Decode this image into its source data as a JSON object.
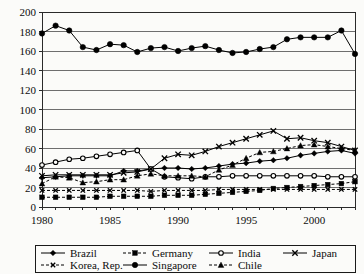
{
  "chart_data": {
    "type": "line",
    "title": "",
    "xlabel": "",
    "ylabel": "",
    "ylim": [
      0,
      200
    ],
    "ytick_step": 20,
    "yticks": [
      0,
      20,
      40,
      60,
      80,
      100,
      120,
      140,
      160,
      180,
      200
    ],
    "xlim": [
      1980,
      2003
    ],
    "xticks": [
      1980,
      1985,
      1990,
      1995,
      2000
    ],
    "x": [
      1980,
      1981,
      1982,
      1983,
      1984,
      1985,
      1986,
      1987,
      1988,
      1989,
      1990,
      1991,
      1992,
      1993,
      1994,
      1995,
      1996,
      1997,
      1998,
      1999,
      2000,
      2001,
      2002,
      2003
    ],
    "grid": "horizontal",
    "legend_position": "bottom",
    "series": [
      {
        "name": "Brazil",
        "marker": "filled-diamond",
        "dash": "solid",
        "values": [
          30,
          31,
          32,
          32,
          32,
          32,
          37,
          37,
          39,
          40,
          40,
          39,
          40,
          42,
          44,
          45,
          47,
          48,
          50,
          53,
          55,
          57,
          58,
          55
        ]
      },
      {
        "name": "Germany",
        "marker": "filled-square",
        "dash": "dashed",
        "values": [
          10,
          10,
          10,
          10,
          10,
          11,
          11,
          11,
          11,
          12,
          12,
          12,
          13,
          14,
          15,
          16,
          17,
          19,
          20,
          21,
          22,
          23,
          24,
          26
        ]
      },
      {
        "name": "India",
        "marker": "open-circle",
        "dash": "solid",
        "values": [
          43,
          46,
          49,
          50,
          52,
          54,
          56,
          58,
          39,
          31,
          30,
          29,
          31,
          31,
          32,
          32,
          32,
          32,
          32,
          32,
          32,
          31,
          31,
          31
        ]
      },
      {
        "name": "Japan",
        "marker": "x-cross",
        "dash": "solid",
        "values": [
          32,
          33,
          33,
          33,
          33,
          33,
          35,
          36,
          39,
          50,
          54,
          53,
          57,
          62,
          66,
          70,
          74,
          78,
          70,
          71,
          68,
          66,
          62,
          58
        ]
      },
      {
        "name": "Korea, Rep.",
        "marker": "x-small",
        "dash": "dashed",
        "values": [
          17,
          17,
          17,
          17,
          17,
          17,
          17,
          17,
          16,
          17,
          17,
          17,
          17,
          18,
          18,
          18,
          18,
          18,
          18,
          18,
          18,
          18,
          18,
          18
        ]
      },
      {
        "name": "Singapore",
        "marker": "filled-circle",
        "dash": "solid",
        "values": [
          178,
          186,
          181,
          164,
          161,
          167,
          166,
          159,
          163,
          164,
          160,
          163,
          165,
          161,
          158,
          159,
          162,
          164,
          172,
          174,
          174,
          174,
          181,
          157
        ]
      },
      {
        "name": "Chile",
        "marker": "filled-triangle",
        "dash": "dashed",
        "values": [
          24,
          31,
          30,
          25,
          26,
          28,
          28,
          32,
          34,
          32,
          32,
          32,
          31,
          38,
          43,
          50,
          56,
          57,
          60,
          63,
          64,
          62,
          60,
          58
        ]
      }
    ]
  },
  "legend": {
    "items": [
      {
        "label": "Brazil"
      },
      {
        "label": "Germany"
      },
      {
        "label": "India"
      },
      {
        "label": "Japan"
      },
      {
        "label": "Korea, Rep."
      },
      {
        "label": "Singapore"
      },
      {
        "label": "Chile"
      }
    ]
  }
}
